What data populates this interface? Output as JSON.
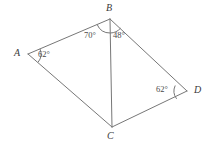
{
  "figure": {
    "type": "geometry-diagram",
    "shape": "quadrilateral-with-diagonal",
    "background_color": "#ffffff",
    "stroke_color": "#777777",
    "label_color": "#3a3a3a",
    "stroke_width": 1
  },
  "vertices": [
    {
      "name": "A",
      "label": "A",
      "x": 28,
      "y": 54,
      "label_x": 14,
      "label_y": 48
    },
    {
      "name": "B",
      "label": "B",
      "x": 110,
      "y": 19,
      "label_x": 106,
      "label_y": 3
    },
    {
      "name": "C",
      "label": "C",
      "x": 112,
      "y": 127,
      "label_x": 107,
      "label_y": 131
    },
    {
      "name": "D",
      "label": "D",
      "x": 187,
      "y": 91,
      "label_x": 194,
      "label_y": 85
    }
  ],
  "edges": [
    {
      "name": "segment-AB",
      "from": "A",
      "to": "B"
    },
    {
      "name": "segment-BD",
      "from": "B",
      "to": "D"
    },
    {
      "name": "segment-DC",
      "from": "D",
      "to": "C"
    },
    {
      "name": "segment-CA",
      "from": "C",
      "to": "A"
    },
    {
      "name": "diagonal-BC",
      "from": "B",
      "to": "C"
    }
  ],
  "angles": [
    {
      "name": "angle-A",
      "vertex": "A",
      "value": 62,
      "text": "62°",
      "label_x": 38,
      "label_y": 50,
      "arc_radius": 13,
      "arc_start_deg": -23,
      "arc_end_deg": 39
    },
    {
      "name": "angle-ABC",
      "vertex": "B",
      "value": 70,
      "text": "70°",
      "label_x": 84,
      "label_y": 31,
      "arc_radius": 14,
      "arc_start_deg": 157,
      "arc_end_deg": 89
    },
    {
      "name": "angle-CBD",
      "vertex": "B",
      "value": 48,
      "text": "48°",
      "label_x": 113,
      "label_y": 31,
      "arc_radius": 14,
      "arc_start_deg": 89,
      "arc_end_deg": 41
    },
    {
      "name": "angle-D",
      "vertex": "D",
      "value": 62,
      "text": "62°",
      "label_x": 156,
      "label_y": 85,
      "arc_radius": 13,
      "arc_start_deg": 205,
      "arc_end_deg": 143
    }
  ]
}
